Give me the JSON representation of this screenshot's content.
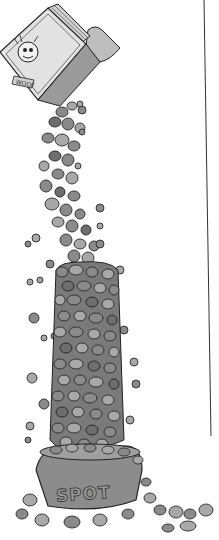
{
  "illustration": {
    "description": "Cartoon of a dog food bag pouring a tall column of kibble into a dog bowl",
    "bowl_label": "SPOT",
    "bag_label": "WOOF",
    "colors": {
      "background": "#ffffff",
      "kibble": "#8a8a8a",
      "outline": "#2a2a2a",
      "bag": "#d8d8d8",
      "divider_line": "#333333"
    }
  }
}
